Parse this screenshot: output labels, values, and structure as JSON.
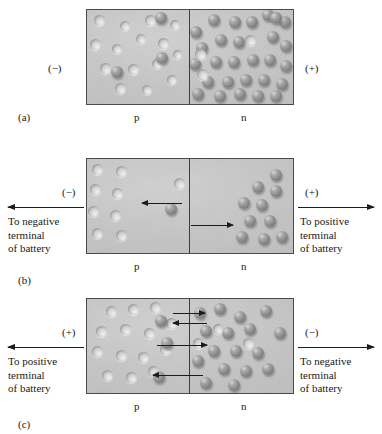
{
  "figure": {
    "region_labels": {
      "p": "p",
      "n": "n"
    }
  },
  "panels": [
    {
      "id": "a",
      "letter": "(a)",
      "left_polarity": "(−)",
      "right_polarity": "(+)",
      "p_label": "p",
      "n_label": "n",
      "battery_left_text": "",
      "battery_right_text": "",
      "has_battery_arrows": false,
      "description": "Equilibrium: holes distributed in p-region, electrons distributed in n-region."
    },
    {
      "id": "b",
      "letter": "(b)",
      "left_polarity": "(−)",
      "right_polarity": "(+)",
      "p_label": "p",
      "n_label": "n",
      "battery_left_text": "To negative\nterminal\nof battery",
      "battery_right_text": "To positive\nterminal\nof battery",
      "has_battery_arrows": true,
      "description": "Reverse bias: carriers pulled away from the junction, depletion region widens."
    },
    {
      "id": "c",
      "letter": "(c)",
      "left_polarity": "(+)",
      "right_polarity": "(−)",
      "p_label": "p",
      "n_label": "n",
      "battery_left_text": "To positive\nterminal\nof battery",
      "battery_right_text": "To negative\nterminal\nof battery",
      "has_battery_arrows": true,
      "description": "Forward bias: carriers driven toward the junction where they recombine."
    }
  ],
  "colors": {
    "block_background": "#c6c6c6",
    "block_border": "#4a4a4a",
    "junction_line": "#3d3d3d",
    "electron": "#8c8c8c",
    "hole": "#dcdcdc",
    "arrow": "#1b1b1b",
    "text": "#1a1a1a",
    "page_background": "#ffffff"
  },
  "carriers": {
    "panel_a": {
      "p_region": {
        "holes": [
          {
            "x": 12,
            "y": 10,
            "r": 5.5
          },
          {
            "x": 38,
            "y": 16,
            "r": 5.0
          },
          {
            "x": 63,
            "y": 10,
            "r": 5.5
          },
          {
            "x": 8,
            "y": 34,
            "r": 5.5
          },
          {
            "x": 30,
            "y": 39,
            "r": 5.0
          },
          {
            "x": 54,
            "y": 29,
            "r": 5.0
          },
          {
            "x": 76,
            "y": 33,
            "r": 5.5
          },
          {
            "x": 18,
            "y": 58,
            "r": 5.5
          },
          {
            "x": 46,
            "y": 59,
            "r": 5.5
          },
          {
            "x": 70,
            "y": 54,
            "r": 5.0
          },
          {
            "x": 88,
            "y": 15,
            "r": 5.0
          },
          {
            "x": 33,
            "y": 78,
            "r": 5.5
          },
          {
            "x": 60,
            "y": 80,
            "r": 5.0
          },
          {
            "x": 85,
            "y": 70,
            "r": 5.0
          },
          {
            "x": 90,
            "y": 44,
            "r": 4.5
          }
        ],
        "electrons": [
          {
            "x": 74,
            "y": 8,
            "r": 6.0
          },
          {
            "x": 75,
            "y": 48,
            "r": 6.0
          },
          {
            "x": 30,
            "y": 62,
            "r": 6.0
          }
        ]
      },
      "n_region": {
        "electrons": [
          {
            "x": 6,
            "y": 22,
            "r": 6.0
          },
          {
            "x": 24,
            "y": 10,
            "r": 6.0
          },
          {
            "x": 45,
            "y": 12,
            "r": 6.0
          },
          {
            "x": 62,
            "y": 12,
            "r": 6.0
          },
          {
            "x": 78,
            "y": 5,
            "r": 6.0
          },
          {
            "x": 95,
            "y": 12,
            "r": 6.0
          },
          {
            "x": 12,
            "y": 38,
            "r": 6.0
          },
          {
            "x": 31,
            "y": 30,
            "r": 6.0
          },
          {
            "x": 49,
            "y": 32,
            "r": 6.0
          },
          {
            "x": 83,
            "y": 27,
            "r": 6.0
          },
          {
            "x": 96,
            "y": 36,
            "r": 6.0
          },
          {
            "x": 5,
            "y": 54,
            "r": 6.0
          },
          {
            "x": 26,
            "y": 52,
            "r": 6.0
          },
          {
            "x": 44,
            "y": 52,
            "r": 6.0
          },
          {
            "x": 63,
            "y": 50,
            "r": 6.0
          },
          {
            "x": 80,
            "y": 50,
            "r": 6.0
          },
          {
            "x": 96,
            "y": 56,
            "r": 6.0
          },
          {
            "x": 18,
            "y": 72,
            "r": 6.0
          },
          {
            "x": 38,
            "y": 72,
            "r": 6.0
          },
          {
            "x": 56,
            "y": 70,
            "r": 6.0
          },
          {
            "x": 74,
            "y": 70,
            "r": 6.0
          },
          {
            "x": 92,
            "y": 74,
            "r": 6.0
          },
          {
            "x": 8,
            "y": 84,
            "r": 6.0
          },
          {
            "x": 30,
            "y": 86,
            "r": 6.0
          },
          {
            "x": 50,
            "y": 84,
            "r": 6.0
          },
          {
            "x": 68,
            "y": 86,
            "r": 6.0
          },
          {
            "x": 86,
            "y": 86,
            "r": 6.0
          },
          {
            "x": 86,
            "y": 8,
            "r": 6.0
          }
        ],
        "holes": [
          {
            "x": 60,
            "y": 30,
            "r": 5.5
          },
          {
            "x": 10,
            "y": 44,
            "r": 5.5
          },
          {
            "x": 12,
            "y": 64,
            "r": 5.5
          }
        ]
      }
    },
    "panel_b": {
      "p_region": {
        "holes": [
          {
            "x": 10,
            "y": 10,
            "r": 5.5
          },
          {
            "x": 34,
            "y": 12,
            "r": 5.5
          },
          {
            "x": 8,
            "y": 30,
            "r": 5.5
          },
          {
            "x": 30,
            "y": 34,
            "r": 5.5
          },
          {
            "x": 6,
            "y": 52,
            "r": 5.5
          },
          {
            "x": 28,
            "y": 56,
            "r": 5.5
          },
          {
            "x": 10,
            "y": 74,
            "r": 5.5
          },
          {
            "x": 34,
            "y": 76,
            "r": 5.5
          },
          {
            "x": 92,
            "y": 24,
            "r": 5.5
          }
        ],
        "electrons": [
          {
            "x": 84,
            "y": 50,
            "r": 6.0
          }
        ]
      },
      "n_region": {
        "electrons": [
          {
            "x": 86,
            "y": 16,
            "r": 6.0
          },
          {
            "x": 68,
            "y": 28,
            "r": 6.0
          },
          {
            "x": 86,
            "y": 32,
            "r": 6.0
          },
          {
            "x": 54,
            "y": 44,
            "r": 6.0
          },
          {
            "x": 72,
            "y": 46,
            "r": 6.0
          },
          {
            "x": 60,
            "y": 62,
            "r": 6.0
          },
          {
            "x": 80,
            "y": 62,
            "r": 6.0
          },
          {
            "x": 52,
            "y": 78,
            "r": 6.0
          },
          {
            "x": 74,
            "y": 80,
            "r": 6.0
          },
          {
            "x": 92,
            "y": 78,
            "r": 6.0
          }
        ],
        "holes": []
      },
      "arrows": [
        {
          "direction": "left",
          "x": 55,
          "y": 44,
          "length": 40
        },
        {
          "direction": "right",
          "x": 104,
          "y": 66,
          "length": 42
        }
      ]
    },
    "panel_c": {
      "p_region": {
        "holes": [
          {
            "x": 24,
            "y": 12,
            "r": 5.5
          },
          {
            "x": 46,
            "y": 10,
            "r": 5.5
          },
          {
            "x": 68,
            "y": 8,
            "r": 5.5
          },
          {
            "x": 14,
            "y": 32,
            "r": 5.5
          },
          {
            "x": 38,
            "y": 30,
            "r": 5.5
          },
          {
            "x": 62,
            "y": 34,
            "r": 5.5
          },
          {
            "x": 10,
            "y": 52,
            "r": 5.5
          },
          {
            "x": 34,
            "y": 56,
            "r": 5.5
          },
          {
            "x": 56,
            "y": 58,
            "r": 5.5
          },
          {
            "x": 20,
            "y": 76,
            "r": 5.5
          },
          {
            "x": 44,
            "y": 78,
            "r": 5.5
          },
          {
            "x": 66,
            "y": 72,
            "r": 5.5
          },
          {
            "x": 78,
            "y": 50,
            "r": 5.5
          },
          {
            "x": 84,
            "y": 24,
            "r": 5.5
          }
        ],
        "electrons": [
          {
            "x": 74,
            "y": 22,
            "r": 6.0
          },
          {
            "x": 80,
            "y": 44,
            "r": 6.0
          },
          {
            "x": 72,
            "y": 78,
            "r": 6.0
          }
        ]
      },
      "n_region": {
        "electrons": [
          {
            "x": 10,
            "y": 14,
            "r": 6.0
          },
          {
            "x": 30,
            "y": 10,
            "r": 6.0
          },
          {
            "x": 50,
            "y": 18,
            "r": 6.0
          },
          {
            "x": 76,
            "y": 12,
            "r": 6.0
          },
          {
            "x": 16,
            "y": 32,
            "r": 6.0
          },
          {
            "x": 38,
            "y": 34,
            "r": 6.0
          },
          {
            "x": 60,
            "y": 30,
            "r": 6.0
          },
          {
            "x": 90,
            "y": 34,
            "r": 6.0
          },
          {
            "x": 24,
            "y": 52,
            "r": 6.0
          },
          {
            "x": 46,
            "y": 52,
            "r": 6.0
          },
          {
            "x": 68,
            "y": 54,
            "r": 6.0
          },
          {
            "x": 8,
            "y": 62,
            "r": 6.0
          },
          {
            "x": 34,
            "y": 70,
            "r": 6.0
          },
          {
            "x": 56,
            "y": 72,
            "r": 6.0
          },
          {
            "x": 78,
            "y": 70,
            "r": 6.0
          },
          {
            "x": 16,
            "y": 84,
            "r": 6.0
          },
          {
            "x": 44,
            "y": 86,
            "r": 6.0
          }
        ],
        "holes": [
          {
            "x": 58,
            "y": 44,
            "r": 5.5
          },
          {
            "x": 8,
            "y": 44,
            "r": 5.5
          },
          {
            "x": 28,
            "y": 30,
            "r": 5.0
          }
        ]
      },
      "arrows": [
        {
          "direction": "right",
          "x": 86,
          "y": 14,
          "length": 32
        },
        {
          "direction": "left",
          "x": 86,
          "y": 24,
          "length": 34
        },
        {
          "direction": "right",
          "x": 70,
          "y": 46,
          "length": 50
        },
        {
          "direction": "left",
          "x": 66,
          "y": 76,
          "length": 50
        }
      ]
    }
  }
}
